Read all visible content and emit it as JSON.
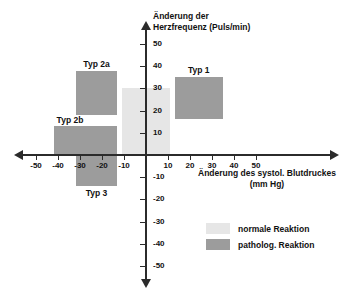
{
  "chart_data": {
    "type": "scatter",
    "title": "",
    "xlabel": "Änderung des systol. Blutdruckes (mm Hg)",
    "ylabel": "Änderung der Herzfrequenz (Puls/min)",
    "xlabel_line1": "Änderung des systol. Blutdruckes",
    "xlabel_line2": "(mm Hg)",
    "ylabel_line1": "Änderung der",
    "ylabel_line2": "Herzfrequenz (Puls/min)",
    "xlim": [
      -55,
      55
    ],
    "ylim": [
      -55,
      55
    ],
    "grid": false,
    "legend_position": "bottom-right",
    "x_ticks": [
      -50,
      -40,
      -30,
      -20,
      -10,
      10,
      20,
      30,
      40,
      50
    ],
    "y_ticks": [
      50,
      40,
      30,
      20,
      10,
      -10,
      -20,
      -30,
      -40,
      -50
    ],
    "x_tick_labels": [
      "-50",
      "-40",
      "-30",
      "-20",
      "-10",
      "10",
      "20",
      "30",
      "40",
      "50"
    ],
    "y_tick_labels": [
      "50",
      "40",
      "30",
      "20",
      "10",
      "-10",
      "-20",
      "-30",
      "-40",
      "-50"
    ],
    "regions": [
      {
        "name": "normale Reaktion",
        "label": "",
        "category": "normal",
        "color": "#e6e6e6",
        "x0": -11,
        "x1": 11,
        "y0": 0,
        "y1": 30
      },
      {
        "name": "Typ 1",
        "label": "Typ 1",
        "category": "pathological",
        "color": "#9c9c9c",
        "x0": 13,
        "x1": 35,
        "y0": 16,
        "y1": 35
      },
      {
        "name": "Typ 2a",
        "label": "Typ 2a",
        "category": "pathological",
        "color": "#9c9c9c",
        "x0": -32,
        "x1": -13,
        "y0": 18,
        "y1": 38
      },
      {
        "name": "Typ 2b",
        "label": "Typ 2b",
        "category": "pathological",
        "color": "#9c9c9c",
        "x0": -42,
        "x1": -13,
        "y0": 0,
        "y1": 13
      },
      {
        "name": "Typ 3",
        "label": "Typ 3",
        "category": "pathological",
        "color": "#9c9c9c",
        "x0": -32,
        "x1": -13,
        "y0": -14,
        "y1": 0
      }
    ],
    "legend": [
      {
        "label": "normale Reaktion",
        "color": "#e6e6e6"
      },
      {
        "label": "patholog. Reaktion",
        "color": "#9c9c9c"
      }
    ]
  },
  "labels": {
    "typ1": "Typ 1",
    "typ2a": "Typ 2a",
    "typ2b": "Typ 2b",
    "typ3": "Typ 3"
  },
  "colors": {
    "normal": "#e6e6e6",
    "pathological": "#9c9c9c",
    "axis": "#2b2b2b",
    "text": "#111111",
    "background": "#ffffff"
  }
}
